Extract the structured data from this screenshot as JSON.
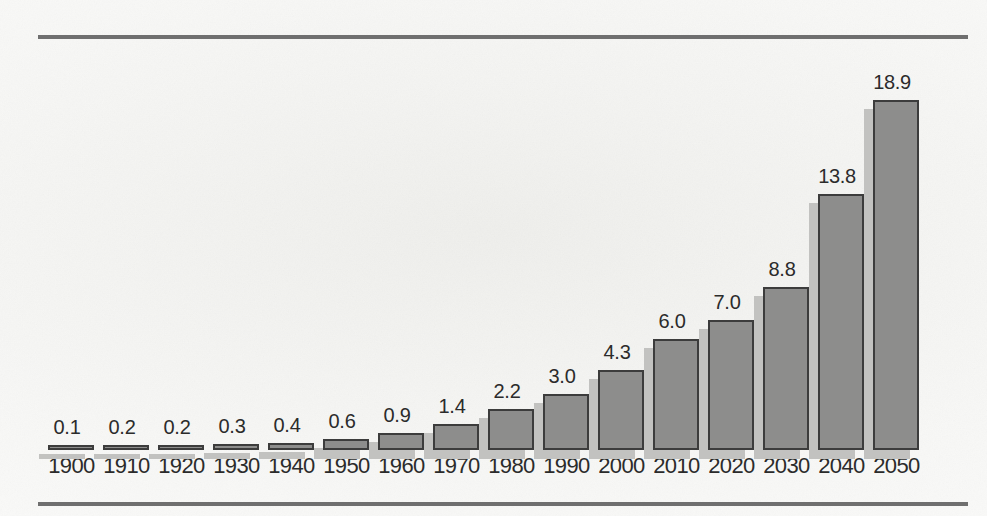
{
  "chart_data": {
    "type": "bar",
    "title": "",
    "subtitle": "",
    "xlabel": "",
    "ylabel": "",
    "grid": false,
    "legend": false,
    "legend_position": "none",
    "value_labels_shown": true,
    "ylim": [
      0,
      18.9
    ],
    "categories": [
      "1900",
      "1910",
      "1920",
      "1930",
      "1940",
      "1950",
      "1960",
      "1970",
      "1980",
      "1990",
      "2000",
      "2010",
      "2020",
      "2030",
      "2040",
      "2050"
    ],
    "values": [
      0.1,
      0.2,
      0.2,
      0.3,
      0.4,
      0.6,
      0.9,
      1.4,
      2.2,
      3.0,
      4.3,
      6.0,
      7.0,
      8.8,
      13.8,
      18.9
    ],
    "value_labels": [
      "0.1",
      "0.2",
      "0.2",
      "0.3",
      "0.4",
      "0.6",
      "0.9",
      "1.4",
      "2.2",
      "3.0",
      "4.3",
      "6.0",
      "7.0",
      "8.8",
      "13.8",
      "18.9"
    ],
    "tick_labels": [
      "1900",
      "1910",
      "1920",
      "1930",
      "1940",
      "1950",
      "1960",
      "1970",
      "1980",
      "1990",
      "2000",
      "2010",
      "2020",
      "2030",
      "2040",
      "2050"
    ]
  },
  "style": {
    "background_color": "#f3f3f1",
    "bar_fill_color": "#8d8d8c",
    "bar_outline_color": "#3c3c3c",
    "bar_shadow_color": "#c2c2c0",
    "rule_color": "#6f6f6f",
    "label_color": "#2b2b2b"
  }
}
